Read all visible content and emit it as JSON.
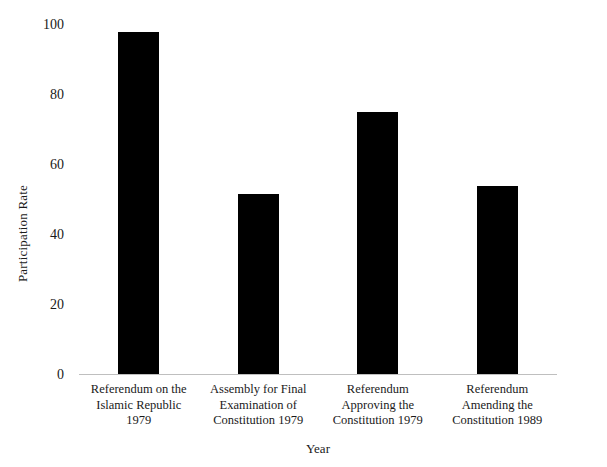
{
  "chart_data": {
    "type": "bar",
    "title": "",
    "xlabel": "Year",
    "ylabel": "Participation Rate",
    "categories": [
      "Referendum on the Islamic Republic 1979",
      "Assembly for Final Examination of Constitution 1979",
      "Referendum Approving the Constitution 1979",
      "Referendum Amending the Constitution 1989"
    ],
    "category_lines": [
      [
        "Referendum on the",
        "Islamic Republic",
        "1979"
      ],
      [
        "Assembly for Final",
        "Examination of",
        "Constitution 1979"
      ],
      [
        "Referendum",
        "Approving the",
        "Constitution 1979"
      ],
      [
        "Referendum",
        "Amending the",
        "Constitution 1989"
      ]
    ],
    "values": [
      98,
      51.5,
      75,
      54
    ],
    "ylim": [
      0,
      100
    ],
    "yticks": [
      0,
      20,
      40,
      60,
      80,
      100
    ],
    "ytick_labels": [
      "0",
      "20",
      "40",
      "60",
      "80",
      "100"
    ],
    "grid": false,
    "legend": "none",
    "bar_color": "#000000",
    "background_color": "#ffffff",
    "axis_color": "#bfbfbf"
  }
}
